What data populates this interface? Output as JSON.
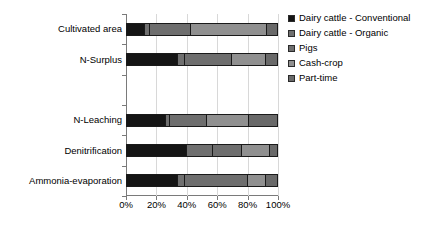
{
  "chart_data": {
    "type": "bar",
    "orientation": "horizontal",
    "stacked": true,
    "normalized": true,
    "title": "",
    "xlabel": "",
    "ylabel": "",
    "xlim": [
      0,
      100
    ],
    "xticks": [
      0,
      20,
      40,
      60,
      80,
      100
    ],
    "xticklabels": [
      "0%",
      "20%",
      "40%",
      "60%",
      "80%",
      "100%"
    ],
    "grid": true,
    "legend_position": "right",
    "categories": [
      "Cultivated area",
      "N-Surplus",
      "N-Leaching",
      "Denitrification",
      "Ammonia-evaporation"
    ],
    "series": [
      {
        "name": "Dairy cattle - Conventional",
        "color": "#151515",
        "values": [
          12.5,
          34,
          26,
          40,
          34
        ]
      },
      {
        "name": "Dairy cattle - Organic",
        "color": "#6f6f6f",
        "values": [
          3.5,
          5,
          3,
          17,
          5
        ]
      },
      {
        "name": "Pigs",
        "color": "#6e6e6e",
        "values": [
          27,
          31,
          24,
          19,
          41
        ]
      },
      {
        "name": "Cash-crop",
        "color": "#909090",
        "values": [
          50,
          22,
          28,
          19,
          12
        ]
      },
      {
        "name": "Part-time",
        "color": "#696969",
        "values": [
          7,
          8,
          19,
          5,
          8
        ]
      }
    ]
  },
  "legend": {
    "items": [
      "Dairy cattle - Conventional",
      "Dairy cattle - Organic",
      "Pigs",
      "Cash-crop",
      "Part-time"
    ]
  }
}
